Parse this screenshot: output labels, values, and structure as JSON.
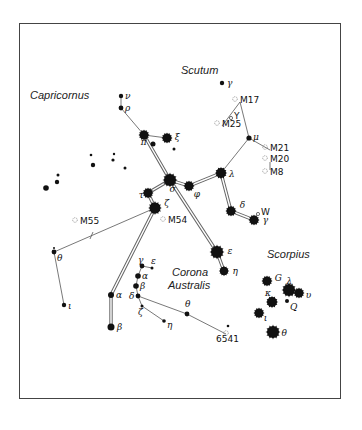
{
  "constellations": [
    {
      "name": "Capricornus",
      "x": 30,
      "y": 99
    },
    {
      "name": "Scutum",
      "x": 181,
      "y": 74
    },
    {
      "name": "Corona",
      "x": 172,
      "y": 276
    },
    {
      "name": "Australis",
      "x": 168,
      "y": 289
    },
    {
      "name": "Scorpius",
      "x": 267,
      "y": 258
    }
  ],
  "deep_sky_objects": [
    {
      "label": "M17",
      "x": 240,
      "y": 102
    },
    {
      "label": "M25",
      "x": 222,
      "y": 126
    },
    {
      "label": "M21",
      "x": 270,
      "y": 150
    },
    {
      "label": "M20",
      "x": 270,
      "y": 161
    },
    {
      "label": "M8",
      "x": 270,
      "y": 174
    },
    {
      "label": "M55",
      "x": 80,
      "y": 223
    },
    {
      "label": "M54",
      "x": 168,
      "y": 222
    },
    {
      "label": "6541",
      "x": 226,
      "y": 341
    }
  ],
  "variable_stars": [
    {
      "label": "Y",
      "x": 235,
      "y": 117
    },
    {
      "label": "W",
      "x": 262,
      "y": 213
    }
  ],
  "stars": [
    {
      "label": "γ",
      "x": 222,
      "y": 83,
      "r": 2.2
    },
    {
      "label": "ν",
      "x": 121,
      "y": 96,
      "r": 2.2
    },
    {
      "label": "ρ",
      "x": 121,
      "y": 108,
      "r": 2.4
    },
    {
      "label": "π",
      "x": 144,
      "y": 135,
      "r": 4.5
    },
    {
      "label": "ξ",
      "x": 167,
      "y": 138,
      "r": 4.5
    },
    {
      "label": "μ",
      "x": 249,
      "y": 138,
      "r": 2.6
    },
    {
      "label": "λ",
      "x": 221,
      "y": 173,
      "r": 5
    },
    {
      "label": "σ",
      "x": 170,
      "y": 180,
      "r": 6
    },
    {
      "label": "φ",
      "x": 189,
      "y": 186,
      "r": 4.5
    },
    {
      "label": "τ",
      "x": 148,
      "y": 193,
      "r": 4.5
    },
    {
      "label": "ζ",
      "x": 155,
      "y": 208,
      "r": 5.5
    },
    {
      "label": "δ",
      "x": 231,
      "y": 211,
      "r": 4.5
    },
    {
      "label": "γ",
      "x": 254,
      "y": 220,
      "r": 4.5
    },
    {
      "label": "ε",
      "x": 217,
      "y": 252,
      "r": 6
    },
    {
      "label": "η",
      "x": 224,
      "y": 271,
      "r": 4.2
    },
    {
      "label": "θ",
      "x": 54,
      "y": 252,
      "r": 2.4
    },
    {
      "label": "ι",
      "x": 64,
      "y": 305,
      "r": 2.2
    },
    {
      "label": "γ",
      "x": 142,
      "y": 266,
      "r": 2.4
    },
    {
      "label": "ε",
      "x": 152,
      "y": 268,
      "r": 1.5
    },
    {
      "label": "α",
      "x": 138,
      "y": 276,
      "r": 2.8
    },
    {
      "label": "β",
      "x": 136,
      "y": 286,
      "r": 2.8
    },
    {
      "label": "α",
      "x": 111,
      "y": 295,
      "r": 3
    },
    {
      "label": "δ",
      "x": 138,
      "y": 296,
      "r": 2.4
    },
    {
      "label": "ζ",
      "x": 142,
      "y": 306,
      "r": 1.5
    },
    {
      "label": "β",
      "x": 111,
      "y": 327,
      "r": 3.5
    },
    {
      "label": "η",
      "x": 164,
      "y": 321,
      "r": 1.8
    },
    {
      "label": "θ",
      "x": 187,
      "y": 314,
      "r": 2.4
    },
    {
      "label": "G",
      "x": 267,
      "y": 281,
      "r": 4.5
    },
    {
      "label": "λ",
      "x": 289,
      "y": 290,
      "r": 6
    },
    {
      "label": "υ",
      "x": 299,
      "y": 293,
      "r": 4.5
    },
    {
      "label": "κ",
      "x": 272,
      "y": 302,
      "r": 5
    },
    {
      "label": "Q",
      "x": 287,
      "y": 301,
      "r": 2
    },
    {
      "label": "ι",
      "x": 259,
      "y": 313,
      "r": 4.5
    },
    {
      "label": "θ",
      "x": 273,
      "y": 332,
      "r": 6
    }
  ],
  "faint_stars": [
    {
      "x": 153,
      "y": 144,
      "r": 2.5
    },
    {
      "x": 174,
      "y": 149,
      "r": 1.5
    },
    {
      "x": 91,
      "y": 155,
      "r": 1.3
    },
    {
      "x": 114,
      "y": 154,
      "r": 1.2
    },
    {
      "x": 113,
      "y": 160,
      "r": 1.6
    },
    {
      "x": 93,
      "y": 165,
      "r": 2.2
    },
    {
      "x": 125,
      "y": 168,
      "r": 1.5
    },
    {
      "x": 58,
      "y": 175,
      "r": 1.5
    },
    {
      "x": 57,
      "y": 182,
      "r": 2.2
    },
    {
      "x": 46,
      "y": 188,
      "r": 2.8
    },
    {
      "x": 54,
      "y": 248,
      "r": 1
    },
    {
      "x": 228,
      "y": 326,
      "r": 1.3
    }
  ],
  "colors": {
    "ink": "#111111",
    "frame": "#444444",
    "line": "#555555"
  }
}
